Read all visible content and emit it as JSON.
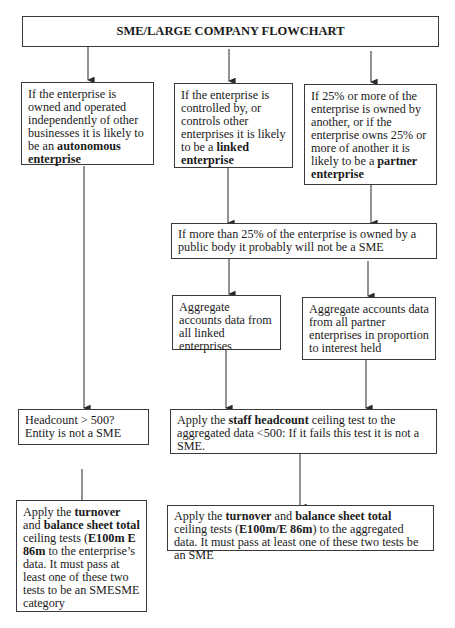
{
  "title": "SME/LARGE COMPANY FLOWCHART",
  "boxes": {
    "autonomous": {
      "text_a": "If the enterprise is owned and operated independently of other businesses it is likely to be an ",
      "bold_a": "autonomous enterprise"
    },
    "linked": {
      "text_a": "If the enterprise is controlled by, or controls other enterprises it is likely to be a ",
      "bold_a": "linked enterprise"
    },
    "partner": {
      "text_a": "If 25% or more of the enterprise is owned by another, or if the enterprise owns 25% or more of another it is likely to be a ",
      "bold_a": "partner enterprise"
    },
    "public_body": {
      "text": "If more than 25% of the enterprise is owned by a public body it probably will not be a SME"
    },
    "aggregate_linked": {
      "text": "Aggregate accounts data from all linked enterprises"
    },
    "aggregate_partner": {
      "text": "Aggregate accounts data from all partner enterprises in proportion to interest held"
    },
    "headcount_autonomous": {
      "line1": "Headcount > 500?",
      "line2": "Entity is not a SME"
    },
    "headcount_aggregated": {
      "text_a": "Apply the ",
      "bold_a": "staff headcount",
      "text_b": " ceiling test to the aggregated data <500: If it fails this test it is not a SME."
    },
    "turnover_autonomous": {
      "text_a": "Apply the ",
      "bold_a": "turnover",
      "text_b": " and ",
      "bold_b": "balance sheet total",
      "text_c": " ceiling tests (",
      "bold_c": "E100m E 86m",
      "text_d": " to the enterprise’s data.  It must pass at least one of these two tests to be an SMESME category"
    },
    "turnover_aggregated": {
      "text_a": "Apply the ",
      "bold_a": "turnover",
      "text_b": " and ",
      "bold_b": "balance sheet total",
      "text_c": " ceiling tests (",
      "bold_c": "E100m/E 86m",
      "text_d": ") to the aggregated data. It must pass at least one of these two tests be an SME"
    }
  },
  "colors": {
    "line": "#3a3a3a",
    "text": "#1a1a1a",
    "background": "#ffffff"
  }
}
